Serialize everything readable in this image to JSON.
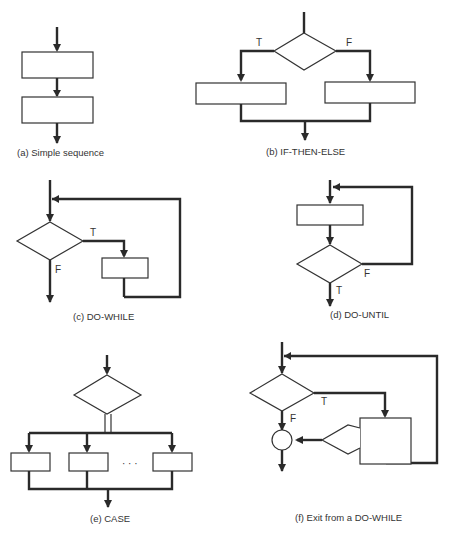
{
  "figure": {
    "panels": [
      {
        "id": "a",
        "caption": "(a)  Simple sequence",
        "labels": []
      },
      {
        "id": "b",
        "caption": "(b)  IF-THEN-ELSE",
        "labels": [
          "T",
          "F"
        ]
      },
      {
        "id": "c",
        "caption": "(c)  DO-WHILE",
        "labels": [
          "T",
          "F"
        ]
      },
      {
        "id": "d",
        "caption": "(d)  DO-UNTIL",
        "labels": [
          "F",
          "T"
        ]
      },
      {
        "id": "e",
        "caption": "(e)  CASE",
        "labels": [
          "· · ·"
        ]
      },
      {
        "id": "f",
        "caption": "(f)  Exit from a DO-WHILE",
        "labels": [
          "T",
          "F"
        ]
      }
    ]
  },
  "colors": {
    "stroke": "#2a2a2a",
    "background": "#ffffff"
  }
}
